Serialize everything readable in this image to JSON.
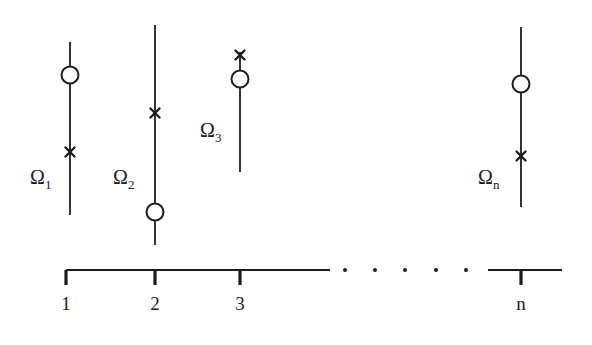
{
  "figure": {
    "kind": "fiber-bundle-diagram",
    "background_color": "#ffffff",
    "ink_color": "#1c1c1c",
    "width": 592,
    "height": 345
  },
  "chart_data": {
    "type": "scatter",
    "title": "",
    "xlabel": "",
    "ylabel": "",
    "grid": false,
    "legend": false,
    "xlim": [
      0,
      592
    ],
    "ylim": [
      345,
      0
    ],
    "axis": {
      "y": 270,
      "left_segment": [
        66,
        330
      ],
      "right_segment": [
        488,
        562
      ],
      "tick_length": 15,
      "ticks": [
        {
          "label": "1",
          "x": 66
        },
        {
          "label": "2",
          "x": 155
        },
        {
          "label": "3",
          "x": 240
        },
        {
          "label": "n",
          "x": 521
        }
      ],
      "tick_label_y": 310,
      "ellipsis_dots_x": [
        345,
        375,
        405,
        436,
        466
      ],
      "ellipsis_dots_y": 270,
      "ellipsis_dot_radius": 2.0
    },
    "fibers": [
      {
        "name": "fiber-1",
        "label": "Ω",
        "subscript": "1",
        "x": 70,
        "top_y": 42,
        "bottom_y": 215,
        "label_x": 30,
        "label_y": 184,
        "markers": [
          {
            "type": "circle",
            "y": 75,
            "radius": 8.5
          },
          {
            "type": "cross",
            "y": 152,
            "size": 9
          }
        ]
      },
      {
        "name": "fiber-2",
        "label": "Ω",
        "subscript": "2",
        "x": 155,
        "top_y": 25,
        "bottom_y": 245,
        "label_x": 113,
        "label_y": 184,
        "markers": [
          {
            "type": "cross",
            "y": 113,
            "size": 9
          },
          {
            "type": "circle",
            "y": 212,
            "radius": 8.5
          }
        ]
      },
      {
        "name": "fiber-3",
        "label": "Ω",
        "subscript": "3",
        "x": 240,
        "top_y": 52,
        "bottom_y": 172,
        "label_x": 200,
        "label_y": 137,
        "markers": [
          {
            "type": "cross",
            "y": 55,
            "size": 9
          },
          {
            "type": "circle",
            "y": 79,
            "radius": 8.5
          }
        ]
      },
      {
        "name": "fiber-n",
        "label": "Ω",
        "subscript": "n",
        "x": 521,
        "top_y": 27,
        "bottom_y": 207,
        "label_x": 478,
        "label_y": 184,
        "markers": [
          {
            "type": "circle",
            "y": 84,
            "radius": 8.5
          },
          {
            "type": "cross",
            "y": 156,
            "size": 9
          }
        ]
      }
    ]
  }
}
